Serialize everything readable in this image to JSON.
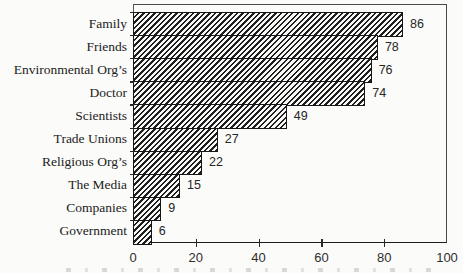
{
  "chart_data": {
    "type": "bar",
    "orientation": "horizontal",
    "title": "",
    "xlabel": "",
    "ylabel": "",
    "categories": [
      "Family",
      "Friends",
      "Environmental Org’s",
      "Doctor",
      "Scientists",
      "Trade Unions",
      "Religious Org’s",
      "The Media",
      "Companies",
      "Government"
    ],
    "values": [
      86,
      78,
      76,
      74,
      49,
      27,
      22,
      15,
      9,
      6
    ],
    "data_labels": [
      "86",
      "78",
      "76",
      "74",
      "49",
      "27",
      "22",
      "15",
      "9",
      "6"
    ],
    "x_ticks": [
      0,
      20,
      40,
      60,
      80,
      100
    ],
    "x_tick_labels": [
      "0",
      "20",
      "40",
      "60",
      "80",
      "100"
    ],
    "xlim": [
      0,
      100
    ],
    "grid": false,
    "legend": false,
    "bar_fill": "diagonal-hatch",
    "hatch_color": "#1f1f1f",
    "bar_background": "#f8f8f6",
    "border_color": "#161616",
    "gap_between_bars": 0
  }
}
